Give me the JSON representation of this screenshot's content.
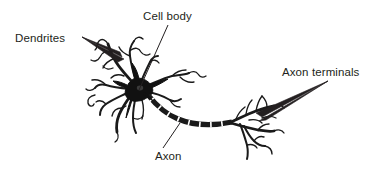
{
  "figure": {
    "background_color": "#ffffff",
    "ink_color": "#1a1a1a",
    "text_color": "#231f20"
  },
  "labels": {
    "dendrites": "Dendrites",
    "cell_body": "Cell body",
    "axon": "Axon",
    "axon_terminals": "Axon terminals"
  },
  "diagram": {
    "parts": [
      "dendrites",
      "cell-body",
      "axon",
      "myelin-segments",
      "axon-terminals"
    ],
    "soma_center": "137,90",
    "axon_start": "150,96",
    "axon_end": "232,122"
  },
  "annotations": {
    "dendrites_pointer": "filled-triangle-arrow",
    "cell_body_pointer": "thin-leader-line",
    "axon_pointer": "thin-leader-line",
    "axon_terminals_pointer": "filled-triangle-arrow"
  }
}
